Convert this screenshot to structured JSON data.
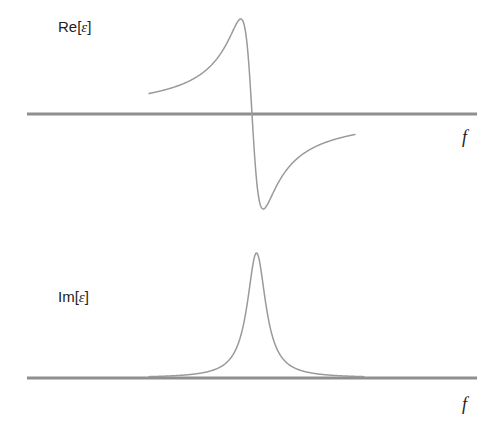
{
  "colors": {
    "axis": "#8f8f8f",
    "curve": "#9a9a9a",
    "text": "#222222",
    "background": "#ffffff"
  },
  "panels": [
    {
      "id": "real",
      "label_prefix": "Re[",
      "label_symbol": "ε",
      "label_suffix": "]",
      "axis_label": "f",
      "curve_type": "lorentzian-dispersive"
    },
    {
      "id": "imag",
      "label_prefix": "Im[",
      "label_symbol": "ε",
      "label_suffix": "]",
      "axis_label": "f",
      "curve_type": "lorentzian-absorptive"
    }
  ],
  "chart_data": [
    {
      "type": "line",
      "title": "Re[ε]",
      "xlabel": "f",
      "ylabel": "Re[ε]",
      "resonance": {
        "f0": 0.5,
        "gamma": 0.025
      },
      "xlim": [
        0,
        1
      ],
      "ylim": [
        -1,
        1
      ],
      "grid": false,
      "series": [
        {
          "name": "Re[ε]",
          "shape": "(f0-f)·γ / ((f0-f)² + γ²), normalized"
        }
      ]
    },
    {
      "type": "line",
      "title": "Im[ε]",
      "xlabel": "f",
      "ylabel": "Im[ε]",
      "resonance": {
        "f0": 0.51,
        "gamma": 0.025
      },
      "xlim": [
        0,
        1
      ],
      "ylim": [
        0,
        1
      ],
      "grid": false,
      "series": [
        {
          "name": "Im[ε]",
          "shape": "γ² / ((f0-f)² + γ²), normalized"
        }
      ]
    }
  ]
}
